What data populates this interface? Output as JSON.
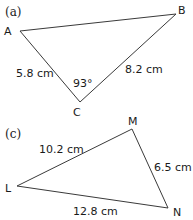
{
  "figures": [
    {
      "part_label": "(a)",
      "vertices": [
        "A",
        "B",
        "C"
      ],
      "sides": [
        {
          "between": "A-C",
          "label": "5.8 cm"
        },
        {
          "between": "B-C",
          "label": "8.2 cm"
        }
      ],
      "angle": {
        "at": "C",
        "label": "93°"
      }
    },
    {
      "part_label": "(c)",
      "vertices": [
        "L",
        "M",
        "N"
      ],
      "sides": [
        {
          "between": "L-M",
          "label": "10.2 cm"
        },
        {
          "between": "M-N",
          "label": "6.5 cm"
        },
        {
          "between": "L-N",
          "label": "12.8 cm"
        }
      ]
    }
  ]
}
